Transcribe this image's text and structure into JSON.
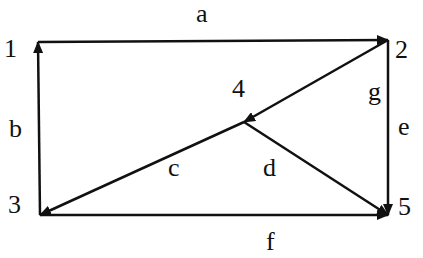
{
  "diagram": {
    "type": "directed-graph",
    "colors": {
      "line": "#111111",
      "background": "#ffffff"
    },
    "nodes": [
      {
        "id": "1",
        "label": "1",
        "x": 38,
        "y": 42,
        "label_x": 4,
        "label_y": 57
      },
      {
        "id": "2",
        "label": "2",
        "x": 388,
        "y": 40,
        "label_x": 395,
        "label_y": 58
      },
      {
        "id": "3",
        "label": "3",
        "x": 40,
        "y": 215,
        "label_x": 8,
        "label_y": 213
      },
      {
        "id": "4",
        "label": "4",
        "x": 244,
        "y": 122,
        "label_x": 232,
        "label_y": 97
      },
      {
        "id": "5",
        "label": "5",
        "x": 388,
        "y": 215,
        "label_x": 398,
        "label_y": 215
      }
    ],
    "edges": [
      {
        "id": "a",
        "label": "a",
        "from": "1",
        "to": "2",
        "label_x": 196,
        "label_y": 22
      },
      {
        "id": "b",
        "label": "b",
        "from": "3",
        "to": "1",
        "label_x": 9,
        "label_y": 137
      },
      {
        "id": "c",
        "label": "c",
        "from": "4",
        "to": "3",
        "label_x": 168,
        "label_y": 176
      },
      {
        "id": "d",
        "label": "d",
        "from": "4",
        "to": "5",
        "label_x": 263,
        "label_y": 176
      },
      {
        "id": "e",
        "label": "e",
        "from": "2",
        "to": "5",
        "label_x": 398,
        "label_y": 135
      },
      {
        "id": "f",
        "label": "f",
        "from": "3",
        "to": "5",
        "label_x": 266,
        "label_y": 250
      },
      {
        "id": "g",
        "label": "g",
        "from": "2",
        "to": "4",
        "label_x": 368,
        "label_y": 100
      }
    ]
  }
}
